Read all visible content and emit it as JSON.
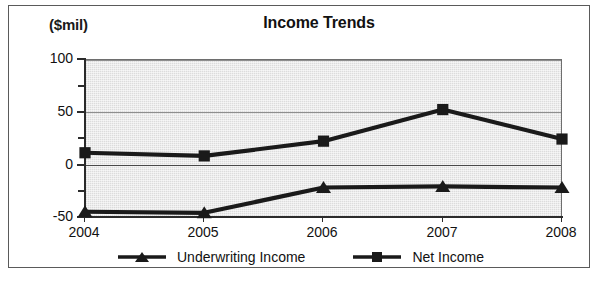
{
  "figure": {
    "unit_label": "($mil)",
    "title": "Income Trends"
  },
  "axes": {
    "y_ticks_major": [
      "100",
      "50",
      "0",
      "-50"
    ],
    "x_ticks": [
      "2004",
      "2005",
      "2006",
      "2007",
      "2008"
    ]
  },
  "legend": {
    "items": [
      {
        "label": "Underwriting Income",
        "marker": "triangle-marker",
        "color": "#1a1a1a"
      },
      {
        "label": "Net Income",
        "marker": "square-marker",
        "color": "#1a1a1a"
      }
    ]
  },
  "chart_data": {
    "type": "line",
    "title": "Income Trends",
    "xlabel": "",
    "ylabel": "($mil)",
    "ylim": [
      -50,
      100
    ],
    "ytick_major": [
      -50,
      0,
      50,
      100
    ],
    "ytick_minor": [
      -25,
      25,
      75
    ],
    "grid": true,
    "legend_position": "bottom",
    "x": [
      "2004",
      "2005",
      "2006",
      "2007",
      "2008"
    ],
    "categories": [
      "2004",
      "2005",
      "2006",
      "2007",
      "2008"
    ],
    "series": [
      {
        "name": "Underwriting Income",
        "marker": "triangle",
        "color": "#1a1a1a",
        "values": [
          -45,
          -46,
          -22,
          -21,
          -22
        ]
      },
      {
        "name": "Net Income",
        "marker": "square",
        "color": "#1a1a1a",
        "values": [
          11,
          8,
          22,
          52,
          24
        ]
      }
    ]
  }
}
